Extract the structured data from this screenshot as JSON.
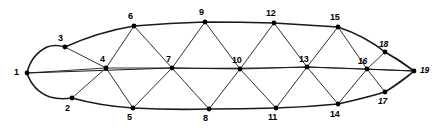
{
  "figure": {
    "type": "graph-diagram",
    "width": 440,
    "height": 128,
    "background_color": "#ffffff",
    "stroke_color": "#1a1a1a",
    "outline_stroke_width": 1.6,
    "inner_stroke_width": 0.9,
    "node_radius": 2.4,
    "node_fill": "#000000"
  },
  "nodes": [
    {
      "id": "1",
      "label": "1",
      "x": 27,
      "y": 73,
      "lx": 14,
      "ly": 68,
      "style": "bold"
    },
    {
      "id": "2",
      "label": "2",
      "x": 72,
      "y": 98,
      "lx": 65,
      "ly": 104,
      "style": "bold"
    },
    {
      "id": "3",
      "label": "3",
      "x": 65,
      "y": 47,
      "lx": 58,
      "ly": 34,
      "style": "bold"
    },
    {
      "id": "4",
      "label": "4",
      "x": 106,
      "y": 68,
      "lx": 100,
      "ly": 55,
      "style": "bold"
    },
    {
      "id": "5",
      "label": "5",
      "x": 133,
      "y": 108,
      "lx": 127,
      "ly": 113,
      "style": "bold"
    },
    {
      "id": "6",
      "label": "6",
      "x": 134,
      "y": 26,
      "lx": 128,
      "ly": 12,
      "style": "bold"
    },
    {
      "id": "7",
      "label": "7",
      "x": 172,
      "y": 68,
      "lx": 166,
      "ly": 55,
      "style": "bold"
    },
    {
      "id": "8",
      "label": "8",
      "x": 209,
      "y": 109,
      "lx": 203,
      "ly": 114,
      "style": "bold"
    },
    {
      "id": "9",
      "label": "9",
      "x": 205,
      "y": 22,
      "lx": 199,
      "ly": 8,
      "style": "bold"
    },
    {
      "id": "10",
      "label": "10",
      "x": 240,
      "y": 69,
      "lx": 232,
      "ly": 56,
      "style": "bold"
    },
    {
      "id": "11",
      "label": "11",
      "x": 276,
      "y": 108,
      "lx": 268,
      "ly": 113,
      "style": "bold"
    },
    {
      "id": "12",
      "label": "12",
      "x": 274,
      "y": 23,
      "lx": 266,
      "ly": 9,
      "style": "bold"
    },
    {
      "id": "13",
      "label": "13",
      "x": 307,
      "y": 67,
      "lx": 299,
      "ly": 55,
      "style": "bold"
    },
    {
      "id": "14",
      "label": "14",
      "x": 338,
      "y": 104,
      "lx": 330,
      "ly": 110,
      "style": "bold"
    },
    {
      "id": "15",
      "label": "15",
      "x": 338,
      "y": 27,
      "lx": 330,
      "ly": 13,
      "style": "bold"
    },
    {
      "id": "16",
      "label": "16",
      "x": 367,
      "y": 69,
      "lx": 358,
      "ly": 57,
      "style": "italic"
    },
    {
      "id": "17",
      "label": "17",
      "x": 385,
      "y": 92,
      "lx": 378,
      "ly": 97,
      "style": "italic"
    },
    {
      "id": "18",
      "label": "18",
      "x": 385,
      "y": 52,
      "lx": 379,
      "ly": 40,
      "style": "italic"
    },
    {
      "id": "19",
      "label": "19",
      "x": 414,
      "y": 71,
      "lx": 420,
      "ly": 66,
      "style": "italic"
    }
  ],
  "outline_paths": [
    {
      "name": "upper-hull",
      "d": "M 27 73 Q 31 55 47 47 Q 55 44 65 47 Q 98 32 134 26 Q 170 23 205 22 Q 240 22 274 23 Q 308 25 338 27 Q 365 36 385 52 Q 400 60 414 71"
    },
    {
      "name": "lower-hull",
      "d": "M 27 73 Q 33 91 50 97 Q 60 100 72 98 Q 101 106 133 108 Q 171 110 209 109 Q 243 109 276 108 Q 308 107 338 104 Q 365 98 385 92 Q 402 82 414 71"
    },
    {
      "name": "median-chord",
      "d": "M 27 73 Q 110 70 172 68 Q 240 69 307 67 Q 362 69 414 71"
    }
  ],
  "inner_edges": [
    {
      "from": "1",
      "to": "4"
    },
    {
      "from": "3",
      "to": "4"
    },
    {
      "from": "2",
      "to": "4"
    },
    {
      "from": "4",
      "to": "6"
    },
    {
      "from": "4",
      "to": "5"
    },
    {
      "from": "6",
      "to": "7"
    },
    {
      "from": "5",
      "to": "7"
    },
    {
      "from": "4",
      "to": "7"
    },
    {
      "from": "7",
      "to": "9"
    },
    {
      "from": "7",
      "to": "8"
    },
    {
      "from": "9",
      "to": "10"
    },
    {
      "from": "8",
      "to": "10"
    },
    {
      "from": "7",
      "to": "10"
    },
    {
      "from": "10",
      "to": "12"
    },
    {
      "from": "10",
      "to": "11"
    },
    {
      "from": "12",
      "to": "13"
    },
    {
      "from": "11",
      "to": "13"
    },
    {
      "from": "10",
      "to": "13"
    },
    {
      "from": "13",
      "to": "15"
    },
    {
      "from": "13",
      "to": "14"
    },
    {
      "from": "15",
      "to": "16"
    },
    {
      "from": "14",
      "to": "16"
    },
    {
      "from": "13",
      "to": "16"
    },
    {
      "from": "16",
      "to": "18"
    },
    {
      "from": "16",
      "to": "17"
    },
    {
      "from": "16",
      "to": "19"
    },
    {
      "from": "18",
      "to": "19"
    },
    {
      "from": "17",
      "to": "19"
    }
  ]
}
